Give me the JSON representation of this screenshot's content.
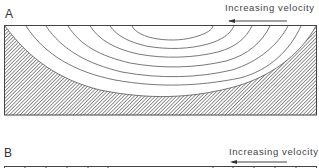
{
  "panels": [
    {
      "id": "A",
      "letter": "A",
      "velocity_label": "Increasing velocity",
      "arrow_direction": "left",
      "description": "Channel cross-section with hatched bed and concentric velocity isovels; highest velocity at top center"
    },
    {
      "id": "B",
      "letter": "B",
      "velocity_label": "Increasing velocity",
      "arrow_direction": "left",
      "description": "Cross-section with vertical division lines along top edge (cropped)"
    }
  ],
  "colors": {
    "line": "#555555",
    "hatch": "#777777",
    "text": "#333333"
  }
}
